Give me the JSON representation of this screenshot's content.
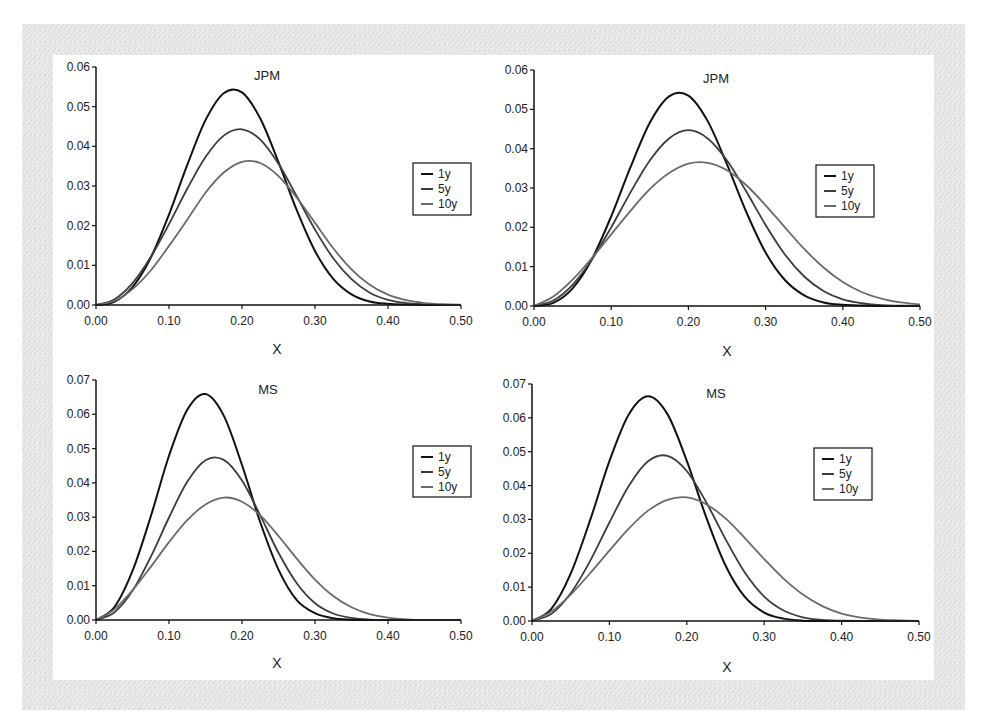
{
  "figure": {
    "panels": [
      "JPM (left)",
      "JPM (right)",
      "MS (left)",
      "MS (right)"
    ]
  },
  "series_colors": {
    "1y": "#111111",
    "5y": "#3c3c3c",
    "10y": "#6a6a6a"
  },
  "chart_data": [
    {
      "type": "line",
      "title": "JPM",
      "xlabel": "X",
      "ylabel": "",
      "xlim": [
        0.0,
        0.5
      ],
      "ylim": [
        0.0,
        0.06
      ],
      "xticks": [
        "0.00",
        "0.10",
        "0.20",
        "0.30",
        "0.40",
        "0.50"
      ],
      "yticks": [
        "0.00",
        "0.01",
        "0.02",
        "0.03",
        "0.04",
        "0.05",
        "0.06"
      ],
      "grid": false,
      "legend_position": "right",
      "x": [
        0,
        0.025,
        0.05,
        0.075,
        0.1,
        0.125,
        0.15,
        0.175,
        0.2,
        0.225,
        0.25,
        0.275,
        0.3,
        0.325,
        0.35,
        0.375,
        0.4,
        0.425,
        0.45,
        0.475,
        0.5
      ],
      "series": [
        {
          "name": "1y",
          "values": [
            0,
            0.0008,
            0.0045,
            0.0119,
            0.0228,
            0.0353,
            0.0466,
            0.0534,
            0.0536,
            0.047,
            0.036,
            0.0239,
            0.0136,
            0.0066,
            0.0027,
            0.0009,
            0.0003,
            0.0001,
            0,
            0,
            0
          ]
        },
        {
          "name": "5y",
          "values": [
            0,
            0.0014,
            0.0055,
            0.0121,
            0.0204,
            0.0293,
            0.0373,
            0.0427,
            0.0443,
            0.0417,
            0.0356,
            0.0274,
            0.019,
            0.0118,
            0.0065,
            0.0031,
            0.0013,
            0.0005,
            0.0002,
            0,
            0
          ]
        },
        {
          "name": "10y",
          "values": [
            0,
            0.001,
            0.004,
            0.0087,
            0.0149,
            0.0215,
            0.0283,
            0.0334,
            0.0361,
            0.0358,
            0.0325,
            0.0271,
            0.0207,
            0.0143,
            0.009,
            0.0051,
            0.0026,
            0.0012,
            0.0005,
            0.0002,
            0.0001
          ]
        }
      ]
    },
    {
      "type": "line",
      "title": "JPM",
      "xlabel": "X",
      "ylabel": "",
      "xlim": [
        0.0,
        0.5
      ],
      "ylim": [
        0.0,
        0.06
      ],
      "xticks": [
        "0.00",
        "0.10",
        "0.20",
        "0.30",
        "0.40",
        "0.50"
      ],
      "yticks": [
        "0.00",
        "0.01",
        "0.02",
        "0.03",
        "0.04",
        "0.05",
        "0.06"
      ],
      "grid": false,
      "legend_position": "right",
      "x": [
        0,
        0.025,
        0.05,
        0.075,
        0.1,
        0.125,
        0.15,
        0.175,
        0.2,
        0.225,
        0.25,
        0.275,
        0.3,
        0.325,
        0.35,
        0.375,
        0.4,
        0.425,
        0.45,
        0.475,
        0.5
      ],
      "series": [
        {
          "name": "1y",
          "values": [
            0,
            0.0008,
            0.0045,
            0.0119,
            0.0228,
            0.0353,
            0.0466,
            0.0533,
            0.0535,
            0.047,
            0.036,
            0.0239,
            0.0136,
            0.0066,
            0.0027,
            0.0009,
            0.0003,
            0.0001,
            0,
            0,
            0
          ]
        },
        {
          "name": "5y",
          "values": [
            0,
            0.0014,
            0.0054,
            0.0118,
            0.02,
            0.0289,
            0.037,
            0.0426,
            0.0447,
            0.0426,
            0.037,
            0.0291,
            0.0206,
            0.0131,
            0.0075,
            0.0038,
            0.0017,
            0.0007,
            0.0002,
            0.0001,
            0
          ]
        },
        {
          "name": "10y",
          "values": [
            0,
            0.0024,
            0.0067,
            0.0122,
            0.0182,
            0.0242,
            0.0297,
            0.0338,
            0.0362,
            0.0364,
            0.0345,
            0.0307,
            0.0256,
            0.02,
            0.0145,
            0.0098,
            0.0061,
            0.0035,
            0.0019,
            0.0009,
            0.0004
          ]
        }
      ]
    },
    {
      "type": "line",
      "title": "MS",
      "xlabel": "X",
      "ylabel": "",
      "xlim": [
        0.0,
        0.5
      ],
      "ylim": [
        0.0,
        0.07
      ],
      "xticks": [
        "0.00",
        "0.10",
        "0.20",
        "0.30",
        "0.40",
        "0.50"
      ],
      "yticks": [
        "0.00",
        "0.01",
        "0.02",
        "0.03",
        "0.04",
        "0.05",
        "0.06",
        "0.07"
      ],
      "grid": false,
      "legend_position": "right",
      "x": [
        0,
        0.025,
        0.05,
        0.075,
        0.1,
        0.125,
        0.15,
        0.175,
        0.2,
        0.225,
        0.25,
        0.275,
        0.3,
        0.325,
        0.35,
        0.375,
        0.4,
        0.425,
        0.45,
        0.475,
        0.5
      ],
      "series": [
        {
          "name": "1y",
          "values": [
            0,
            0.0037,
            0.0143,
            0.0302,
            0.0479,
            0.0613,
            0.0659,
            0.0596,
            0.0452,
            0.0285,
            0.0147,
            0.0058,
            0.002,
            0.0005,
            0.0001,
            0,
            0,
            0,
            0,
            0,
            0
          ]
        },
        {
          "name": "5y",
          "values": [
            0,
            0.0022,
            0.0085,
            0.0184,
            0.0299,
            0.0403,
            0.0466,
            0.0467,
            0.0407,
            0.0305,
            0.0196,
            0.0107,
            0.0049,
            0.0019,
            0.0006,
            0.0001,
            0,
            0,
            0,
            0,
            0
          ]
        },
        {
          "name": "10y",
          "values": [
            0,
            0.0031,
            0.0087,
            0.0155,
            0.0227,
            0.0291,
            0.0337,
            0.0357,
            0.0345,
            0.0305,
            0.0245,
            0.0179,
            0.0118,
            0.007,
            0.0037,
            0.0017,
            0.0007,
            0.0002,
            0,
            0,
            0
          ]
        }
      ]
    },
    {
      "type": "line",
      "title": "MS",
      "xlabel": "X",
      "ylabel": "",
      "xlim": [
        0.0,
        0.5
      ],
      "ylim": [
        0.0,
        0.07
      ],
      "xticks": [
        "0.00",
        "0.10",
        "0.20",
        "0.30",
        "0.40",
        "0.50"
      ],
      "yticks": [
        "0.00",
        "0.01",
        "0.02",
        "0.03",
        "0.04",
        "0.05",
        "0.06",
        "0.07"
      ],
      "grid": false,
      "legend_position": "right",
      "x": [
        0,
        0.025,
        0.05,
        0.075,
        0.1,
        0.125,
        0.15,
        0.175,
        0.2,
        0.225,
        0.25,
        0.275,
        0.3,
        0.325,
        0.35,
        0.375,
        0.4,
        0.425,
        0.45,
        0.475,
        0.5
      ],
      "series": [
        {
          "name": "1y",
          "values": [
            0,
            0.0036,
            0.014,
            0.0297,
            0.0472,
            0.061,
            0.0664,
            0.0611,
            0.0473,
            0.0307,
            0.0164,
            0.0071,
            0.0025,
            0.0007,
            0.0001,
            0,
            0,
            0,
            0,
            0,
            0
          ]
        },
        {
          "name": "5y",
          "values": [
            0,
            0.0021,
            0.0082,
            0.0177,
            0.0291,
            0.0399,
            0.0472,
            0.0488,
            0.0443,
            0.0351,
            0.0242,
            0.0143,
            0.0072,
            0.0031,
            0.0011,
            0.0003,
            0.0001,
            0,
            0,
            0,
            0
          ]
        },
        {
          "name": "10y",
          "values": [
            0,
            0.0028,
            0.0078,
            0.0141,
            0.0208,
            0.0273,
            0.0326,
            0.0358,
            0.0365,
            0.0345,
            0.0303,
            0.0245,
            0.0183,
            0.0125,
            0.0078,
            0.0044,
            0.0022,
            0.001,
            0.0004,
            0.0002,
            0
          ]
        }
      ]
    }
  ],
  "layout": {
    "panels": [
      {
        "origin": [
          96,
          305
        ],
        "x_end": 461,
        "y_top": 67,
        "title_pos": [
          267,
          80
        ],
        "xlabel_pos": [
          277,
          354
        ],
        "legend": [
          413,
          163,
          58,
          52
        ]
      },
      {
        "origin": [
          534,
          306
        ],
        "x_end": 920,
        "y_top": 70,
        "title_pos": [
          716,
          83
        ],
        "xlabel_pos": [
          727,
          356
        ],
        "legend": [
          816,
          165,
          58,
          52
        ]
      },
      {
        "origin": [
          96,
          620
        ],
        "x_end": 461,
        "y_top": 380,
        "title_pos": [
          268,
          394
        ],
        "xlabel_pos": [
          277,
          668
        ],
        "legend": [
          413,
          446,
          58,
          51
        ]
      },
      {
        "origin": [
          532,
          621
        ],
        "x_end": 919,
        "y_top": 384,
        "title_pos": [
          716,
          398
        ],
        "xlabel_pos": [
          727,
          672
        ],
        "legend": [
          814,
          448,
          58,
          52
        ]
      }
    ]
  }
}
